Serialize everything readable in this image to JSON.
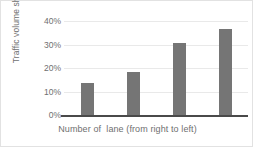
{
  "chart_data": {
    "type": "bar",
    "title": "",
    "xlabel": "Number of  lane (from right to left)",
    "ylabel": "Traffic volume share",
    "categories": [
      "1",
      "2",
      "3",
      "4"
    ],
    "values": [
      13.7,
      18.5,
      30.5,
      36.5
    ],
    "ylim": [
      0,
      40
    ],
    "ytick_labels": [
      "40%",
      "30%",
      "20%",
      "10%",
      "0%"
    ],
    "ytick_values": [
      40,
      30,
      20,
      10,
      0
    ],
    "grid": true,
    "legend": false,
    "bar_color": "#757575",
    "gridline_color": "#e9e9e9",
    "axis_color": "#4a4a4a",
    "text_color": "#6f6f6f"
  }
}
